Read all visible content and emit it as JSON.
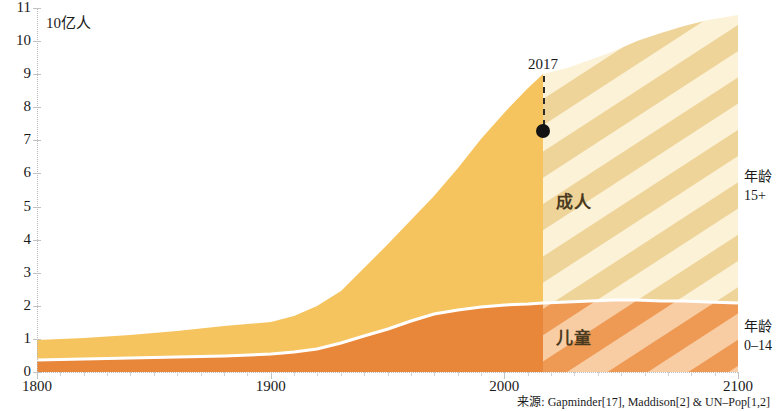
{
  "chart": {
    "unit_label": "10亿人",
    "source_note": "来源: Gapminder[17], Maddison[2] & UN–Pop[1,2]",
    "annotation_year": "2017",
    "label_adults": "成人",
    "label_children": "儿童",
    "edge_adults_line1": "年龄",
    "edge_adults_line2": "15+",
    "edge_children_line1": "年龄",
    "edge_children_line2": "0–14",
    "colors": {
      "adults": "#F5C45E",
      "adults_future_stripe": "#EFD9A0",
      "adults_future_base": "#FAF0D2",
      "children": "#E8873A",
      "children_future_stripe": "#F0A766",
      "children_future_base": "#F7C79B",
      "separator": "#FFFFFF",
      "annotation": "#131313",
      "axis": "#BDBDBD",
      "text": "#1A1A1A"
    }
  },
  "chart_data": {
    "type": "area",
    "title": "",
    "subtitle": "",
    "xlabel": "",
    "ylabel": "10亿人",
    "xlim": [
      1800,
      2100
    ],
    "ylim": [
      0,
      11
    ],
    "grid": false,
    "legend_position": "inside-and-right-edge",
    "stacked": true,
    "y_ticks": [
      0,
      1,
      2,
      3,
      4,
      5,
      6,
      7,
      8,
      9,
      10,
      11
    ],
    "x_ticks": [
      1800,
      1900,
      2000,
      2100
    ],
    "x_minor_tick_step": 10,
    "forecast_start_year": 2017,
    "annotations": [
      {
        "label": "2017",
        "x": 2017,
        "y": 7.5,
        "marker": "dot"
      }
    ],
    "x": [
      1800,
      1820,
      1840,
      1860,
      1880,
      1900,
      1920,
      1940,
      1950,
      1960,
      1970,
      1980,
      1990,
      2000,
      2010,
      2017,
      2020,
      2030,
      2040,
      2050,
      2060,
      2070,
      2080,
      2090,
      2100
    ],
    "series": [
      {
        "name": "儿童",
        "age_group": "0–14",
        "values": [
          0.35,
          0.37,
          0.4,
          0.44,
          0.48,
          0.53,
          0.58,
          0.68,
          0.87,
          1.07,
          1.3,
          1.55,
          1.72,
          1.82,
          1.93,
          1.97,
          1.98,
          2.0,
          2.01,
          2.0,
          1.98,
          1.96,
          1.94,
          1.92,
          1.9
        ]
      },
      {
        "name": "成人",
        "age_group": "15+",
        "values": [
          0.6,
          0.65,
          0.72,
          0.79,
          0.87,
          0.97,
          1.12,
          1.62,
          1.66,
          1.95,
          2.4,
          2.89,
          3.58,
          4.3,
          5.0,
          5.53,
          5.72,
          6.6,
          7.4,
          8.1,
          8.7,
          9.15,
          9.5,
          9.77,
          9.97
        ]
      }
    ],
    "totals": [
      0.95,
      1.02,
      1.12,
      1.23,
      1.35,
      1.5,
      1.7,
      2.3,
      2.53,
      3.02,
      3.7,
      4.44,
      5.3,
      6.12,
      6.93,
      7.5,
      7.7,
      8.6,
      9.41,
      10.1,
      10.68,
      11.11,
      11.44,
      11.69,
      11.87
    ]
  }
}
